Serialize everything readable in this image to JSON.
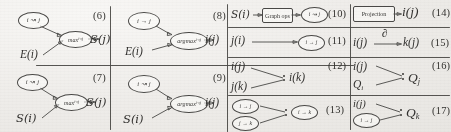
{
  "figure": {
    "kind": "scanned-diagram-grid",
    "panel_count": 12,
    "ink_color": "#4a4947",
    "paper_color": "#efeeec"
  },
  "panels": [
    {
      "number": "(6)",
      "nodes": [
        {
          "name": "relation-node",
          "label": "i ↝ j"
        },
        {
          "name": "operator-node",
          "label": "max",
          "subscript": "i↝j"
        }
      ],
      "inputs": [
        {
          "name": "input-term",
          "label": "E(i)"
        }
      ],
      "output": {
        "name": "output-term",
        "label": "S(j)"
      }
    },
    {
      "number": "(7)",
      "nodes": [
        {
          "name": "relation-node",
          "label": "i ↝ j"
        },
        {
          "name": "operator-node",
          "label": "max",
          "subscript": "i↝j"
        }
      ],
      "inputs": [
        {
          "name": "input-term",
          "label": "S(i)"
        }
      ],
      "output": {
        "name": "output-term",
        "label": "S(j)"
      }
    },
    {
      "number": "(8)",
      "nodes": [
        {
          "name": "relation-node",
          "label": "i → j"
        },
        {
          "name": "operator-node",
          "label": "argmax",
          "subscript": "i↝j"
        }
      ],
      "inputs": [
        {
          "name": "input-term",
          "label": "E(i)"
        }
      ],
      "output": {
        "name": "output-term",
        "label": "i(j)"
      }
    },
    {
      "number": "(9)",
      "nodes": [
        {
          "name": "relation-node",
          "label": "i ↝ j"
        },
        {
          "name": "operator-node",
          "label": "argmax",
          "subscript": "i↝j"
        }
      ],
      "inputs": [
        {
          "name": "input-term",
          "label": "S(i)"
        }
      ],
      "output": {
        "name": "output-term",
        "label": "i(j)"
      }
    },
    {
      "number": "(10)",
      "inputs": [
        {
          "name": "input-term",
          "label": "S(i)"
        }
      ],
      "box": {
        "name": "graph-box",
        "label": "Graph ops"
      },
      "nodes": [
        {
          "name": "relation-node",
          "label": "i ↝ j"
        }
      ]
    },
    {
      "number": "(11)",
      "inputs": [
        {
          "name": "input-term",
          "label": "j(i)"
        }
      ],
      "nodes": [
        {
          "name": "relation-node",
          "label": "i → j"
        }
      ]
    },
    {
      "number": "(12)",
      "inputs": [
        {
          "name": "input-term",
          "label": "i(j)"
        },
        {
          "name": "input-term",
          "label": "j(k)"
        }
      ],
      "output": {
        "name": "output-term",
        "label": "i(k)"
      }
    },
    {
      "number": "(13)",
      "nodes": [
        {
          "name": "relation-node",
          "label": "i → j"
        },
        {
          "name": "relation-node",
          "label": "j → k"
        },
        {
          "name": "relation-node",
          "label": "i → k"
        }
      ]
    },
    {
      "number": "(14)",
      "box": {
        "name": "projection-box",
        "label": "Projection"
      },
      "output": {
        "name": "output-term",
        "label": "i(j)"
      }
    },
    {
      "number": "(15)",
      "inputs": [
        {
          "name": "input-term",
          "label": "i(j)"
        }
      ],
      "edge_label": "∂",
      "output": {
        "name": "output-term",
        "label": "k(j)"
      }
    },
    {
      "number": "(16)",
      "inputs": [
        {
          "name": "input-term",
          "label": "i(j)"
        },
        {
          "name": "input-term",
          "label": "Q",
          "subscript": "i"
        }
      ],
      "output": {
        "name": "output-term",
        "label": "Q",
        "subscript": "j"
      }
    },
    {
      "number": "(17)",
      "inputs": [
        {
          "name": "input-term",
          "label": "i(j)"
        }
      ],
      "nodes": [
        {
          "name": "relation-node",
          "label": "i → j"
        }
      ],
      "output": {
        "name": "output-term",
        "label": "Q",
        "subscript": "k"
      }
    }
  ]
}
